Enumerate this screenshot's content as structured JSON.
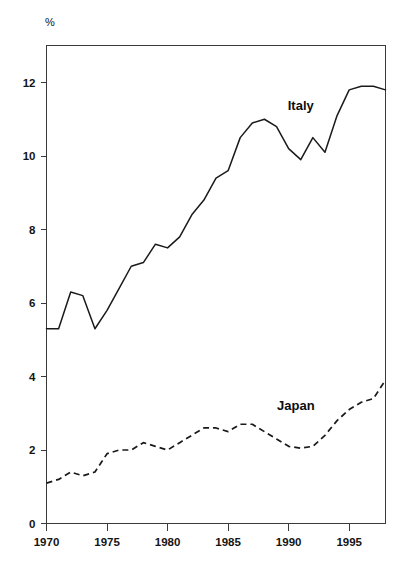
{
  "chart_data": {
    "type": "line",
    "title": "",
    "subtitle": "",
    "xlabel": "",
    "ylabel": "%",
    "unit_label": "%",
    "xlim": [
      1970,
      1998
    ],
    "ylim": [
      0,
      13
    ],
    "y_axis_display_max": 13,
    "grid": false,
    "legend": "inline-annotations",
    "x_ticks": [
      1970,
      1975,
      1980,
      1985,
      1990,
      1995
    ],
    "x_tick_labels": [
      "1970",
      "1975",
      "1980",
      "1985",
      "1990",
      "1995"
    ],
    "y_ticks": [
      0,
      2,
      4,
      6,
      8,
      10,
      12
    ],
    "y_tick_labels": [
      "0",
      "2",
      "4",
      "6",
      "8",
      "10",
      "12"
    ],
    "x": [
      1970,
      1971,
      1972,
      1973,
      1974,
      1975,
      1976,
      1977,
      1978,
      1979,
      1980,
      1981,
      1982,
      1983,
      1984,
      1985,
      1986,
      1987,
      1988,
      1989,
      1990,
      1991,
      1992,
      1993,
      1994,
      1995,
      1996,
      1997,
      1998
    ],
    "series": [
      {
        "name": "Italy",
        "style": "solid",
        "color": "#1a1a1a",
        "label_x": 1991.0,
        "label_y": 11.25,
        "values": [
          5.3,
          5.3,
          6.3,
          6.2,
          5.3,
          5.8,
          6.4,
          7.0,
          7.1,
          7.6,
          7.5,
          7.8,
          8.4,
          8.8,
          9.4,
          9.6,
          10.5,
          10.9,
          11.0,
          10.8,
          10.2,
          9.9,
          10.5,
          10.1,
          11.1,
          11.8,
          11.9,
          11.9,
          11.8
        ]
      },
      {
        "name": "Japan",
        "style": "dashed",
        "color": "#1a1a1a",
        "label_x": 1990.6,
        "label_y": 3.1,
        "values": [
          1.1,
          1.2,
          1.4,
          1.3,
          1.4,
          1.9,
          2.0,
          2.0,
          2.2,
          2.1,
          2.0,
          2.2,
          2.4,
          2.6,
          2.6,
          2.5,
          2.7,
          2.7,
          2.5,
          2.3,
          2.1,
          2.05,
          2.1,
          2.4,
          2.8,
          3.1,
          3.3,
          3.4,
          3.9
        ]
      }
    ]
  }
}
